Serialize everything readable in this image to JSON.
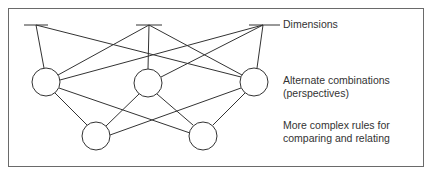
{
  "diagram": {
    "labels": {
      "dimensions": "Dimensions",
      "alternate_line1": "Alternate combinations",
      "alternate_line2": "(perspectives)",
      "rules_line1": "More complex rules for",
      "rules_line2": "comparing and relating"
    },
    "colors": {
      "line": "#333333",
      "frame": "#6a6a6a",
      "background": "#ffffff"
    },
    "levels": [
      {
        "name": "Dimensions",
        "nodes": [
          {
            "id": "d1",
            "type": "bar",
            "x": 36,
            "y": 25
          },
          {
            "id": "d2",
            "type": "bar",
            "x": 149,
            "y": 25
          },
          {
            "id": "d3",
            "type": "bar",
            "x": 263,
            "y": 25
          }
        ]
      },
      {
        "name": "Alternate combinations (perspectives)",
        "nodes": [
          {
            "id": "p1",
            "type": "circle",
            "x": 46,
            "y": 82
          },
          {
            "id": "p2",
            "type": "circle",
            "x": 148,
            "y": 83
          },
          {
            "id": "p3",
            "type": "circle",
            "x": 254,
            "y": 82
          }
        ]
      },
      {
        "name": "More complex rules for comparing and relating",
        "nodes": [
          {
            "id": "r1",
            "type": "circle",
            "x": 96,
            "y": 136
          },
          {
            "id": "r2",
            "type": "circle",
            "x": 203,
            "y": 136
          }
        ]
      }
    ],
    "edges": [
      [
        "d1",
        "p1"
      ],
      [
        "d1",
        "p3"
      ],
      [
        "d2",
        "p1"
      ],
      [
        "d2",
        "p2"
      ],
      [
        "d2",
        "p3"
      ],
      [
        "d3",
        "p1"
      ],
      [
        "d3",
        "p2"
      ],
      [
        "d3",
        "p3"
      ],
      [
        "p1",
        "r1"
      ],
      [
        "p1",
        "r2"
      ],
      [
        "p2",
        "r1"
      ],
      [
        "p2",
        "r2"
      ],
      [
        "p3",
        "r1"
      ],
      [
        "p3",
        "r2"
      ]
    ]
  }
}
